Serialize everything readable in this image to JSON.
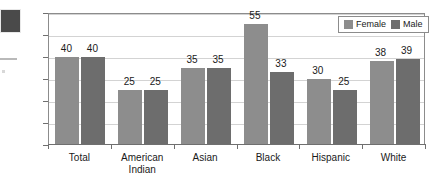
{
  "chart_data": {
    "type": "bar",
    "title": "",
    "subtitle": "",
    "xlabel": "",
    "ylabel": "",
    "ylim": [
      0,
      60
    ],
    "ytick_labels": [
      "0",
      "10",
      "20",
      "30",
      "40",
      "50",
      "60"
    ],
    "ytick_values": [
      0,
      10,
      20,
      30,
      40,
      50,
      60
    ],
    "grid": true,
    "legend_position": "top-right",
    "categories": [
      "Total",
      "American\nIndian",
      "Asian",
      "Black",
      "Hispanic",
      "White"
    ],
    "series": [
      {
        "name": "Female",
        "color": "#8d8d8d",
        "values": [
          40,
          25,
          35,
          55,
          30,
          38
        ],
        "labels": [
          "40",
          "25",
          "35",
          "55",
          "30",
          "38"
        ]
      },
      {
        "name": "Male",
        "color": "#6d6d6d",
        "values": [
          40,
          25,
          35,
          33,
          25,
          39
        ],
        "labels": [
          "40",
          "25",
          "35",
          "33",
          "25",
          "39"
        ]
      }
    ]
  },
  "legend": {
    "entries": [
      {
        "label": "Female",
        "swatch": "female-swatch-icon"
      },
      {
        "label": "Male",
        "swatch": "male-swatch-icon"
      }
    ]
  },
  "colors": {
    "female_bar": "#8d8d8d",
    "male_bar": "#6d6d6d",
    "gridline": "#d3d3d3",
    "axis": "#8c8c8c",
    "text": "#1a1a1a",
    "background": "#ffffff"
  }
}
